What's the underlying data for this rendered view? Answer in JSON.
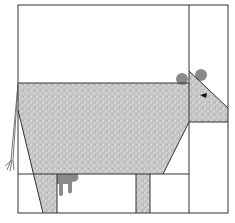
{
  "diagram": {
    "colors": {
      "background": "#ffffff",
      "outline": "#333333",
      "fabric_fill": "#c8c8c8",
      "fabric_speckle": "#f0f0f0",
      "ear_fill": "#8a8a8a",
      "udder_fill": "#8a8a8a",
      "eye_fill": "#111111",
      "tail_stroke": "#777777"
    },
    "pieces": [
      "frame",
      "head-column-divider",
      "leg-row-divider",
      "body",
      "head",
      "left-ear",
      "right-ear",
      "eye",
      "front-leg",
      "back-leg",
      "udder",
      "tail",
      "head-bottom-seam"
    ]
  }
}
